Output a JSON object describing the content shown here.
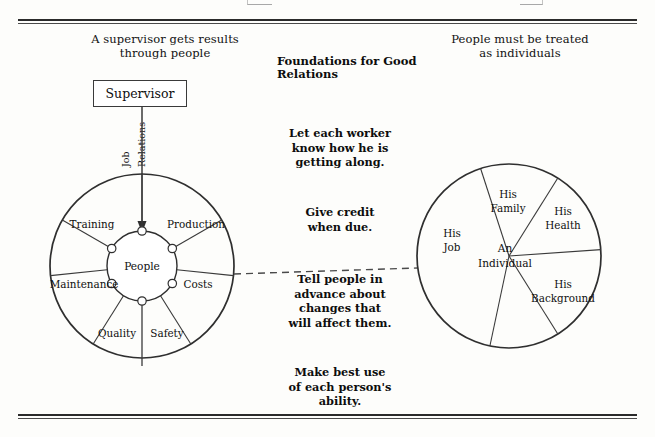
{
  "page": {
    "title": "Foundations for Good Relations",
    "headings": {
      "left": "A supervisor gets results\nthrough people",
      "right": "People must be treated\nas individuals"
    }
  },
  "supervisor": {
    "box_label": "Supervisor",
    "connector_labels": [
      "Job",
      "Relations"
    ]
  },
  "left_wheel": {
    "hub_label": "People",
    "segments": [
      {
        "label": "Production"
      },
      {
        "label": "Costs"
      },
      {
        "label": "Safety"
      },
      {
        "label": "Quality"
      },
      {
        "label": "Maintenance"
      },
      {
        "label": "Training"
      }
    ]
  },
  "right_wheel": {
    "hub_label": "An\nIndividual",
    "hub_line1": "An",
    "hub_line2": "Individual",
    "segments": [
      {
        "label_line1": "His",
        "label_line2": "Family"
      },
      {
        "label_line1": "His",
        "label_line2": "Health"
      },
      {
        "label_line1": "His",
        "label_line2": "Background"
      },
      {
        "label_line1": "His",
        "label_line2": "Job"
      }
    ]
  },
  "advice": [
    "Let each worker\nknow how he is\ngetting along.",
    "Give credit\nwhen due.",
    "Tell people in\nadvance about\nchanges that\nwill affect them.",
    "Make best use\nof each person's\nability."
  ],
  "colors": {
    "ink": "#0f0f0f",
    "line": "#3a3a3a",
    "paper": "#fdfdfb"
  }
}
